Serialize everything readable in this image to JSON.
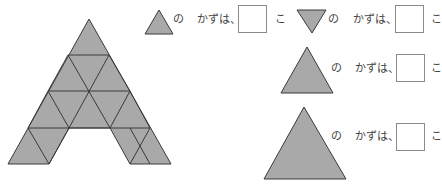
{
  "worksheet": {
    "figure_name": "letter-A-triangle-figure",
    "colors": {
      "fill": "#a9a9a9",
      "stroke": "#3a3a3a"
    },
    "questions": [
      {
        "shape": "small-up-triangle",
        "no": "の",
        "label": "かずは、",
        "answer": "",
        "unit": "こ"
      },
      {
        "shape": "small-down-triangle",
        "no": "の",
        "label": "かずは、",
        "answer": "",
        "unit": "こ"
      },
      {
        "shape": "medium-up-triangle",
        "no": "の",
        "label": "かずは、",
        "answer": "",
        "unit": "こ"
      },
      {
        "shape": "large-up-triangle",
        "no": "の",
        "label": "かずは、",
        "answer": "",
        "unit": "こ"
      }
    ]
  }
}
